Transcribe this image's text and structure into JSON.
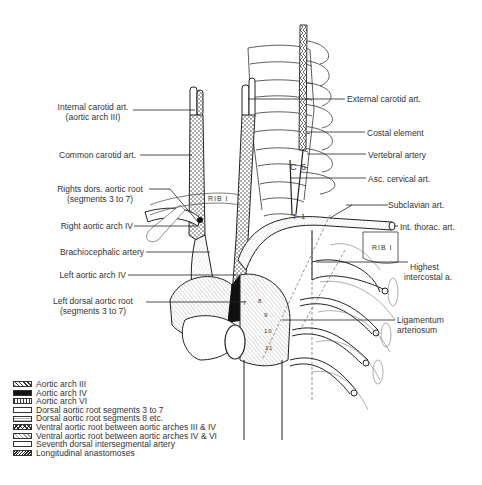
{
  "labels_left": [
    {
      "id": "internal-carotid",
      "lines": [
        "Internal carotid art.",
        "(aortic arch III)"
      ],
      "x": 132,
      "y": 107
    },
    {
      "id": "common-carotid",
      "lines": [
        "Common carotid art."
      ],
      "x": 137,
      "y": 153
    },
    {
      "id": "right-dorsal-aortic-root",
      "lines": [
        "Rights dors. aortic root",
        "(segments 3 to 7)"
      ],
      "x": 149,
      "y": 187
    },
    {
      "id": "right-aortic-arch-iv",
      "lines": [
        "Right aortic arch IV"
      ],
      "x": 134,
      "y": 222
    },
    {
      "id": "brachiocephalic",
      "lines": [
        "Brachiocephalic artery"
      ],
      "x": 144,
      "y": 251
    },
    {
      "id": "left-aortic-arch-iv",
      "lines": [
        "Left aortic arch IV"
      ],
      "x": 125,
      "y": 272
    },
    {
      "id": "left-dorsal-aortic-root",
      "lines": [
        "Left dorsal aortic root",
        "(segments 3 to 7)"
      ],
      "x": 140,
      "y": 296
    }
  ],
  "labels_right": [
    {
      "id": "external-carotid",
      "lines": [
        "External carotid art."
      ],
      "x": 346,
      "y": 95
    },
    {
      "id": "costal-element",
      "lines": [
        "Costal element"
      ],
      "x": 367,
      "y": 128
    },
    {
      "id": "vertebral-artery",
      "lines": [
        "Vertebral artery"
      ],
      "x": 368,
      "y": 150
    },
    {
      "id": "asc-cervical",
      "lines": [
        "Asc. cervical art."
      ],
      "x": 368,
      "y": 175
    },
    {
      "id": "subclavian",
      "lines": [
        "Subclavian art."
      ],
      "x": 388,
      "y": 200
    },
    {
      "id": "int-thoracic",
      "lines": [
        "Int. thorac. art."
      ],
      "x": 399,
      "y": 223
    },
    {
      "id": "highest-intercostal",
      "lines": [
        "Highest",
        "intercostal a."
      ],
      "x": 411,
      "y": 259
    },
    {
      "id": "ligamentum-arteriosum",
      "lines": [
        "Ligamentum",
        "arteriosum"
      ],
      "x": 397,
      "y": 316
    }
  ],
  "anatomical_tags": {
    "c6": "C 6",
    "t1": "T 1",
    "rib1_left": "RIB I",
    "rib1_right": "RIB I",
    "seg7": "7",
    "seg8": "8",
    "seg9": "9",
    "seg10": "10",
    "seg11": "11"
  },
  "legend": [
    {
      "label": "Aortic arch III",
      "pattern": "dots"
    },
    {
      "label": "Aortic arch IV",
      "pattern": "black"
    },
    {
      "label": "Aortic arch VI",
      "pattern": "vbars"
    },
    {
      "label": "Dorsal aortic root  segments 3 to 7",
      "pattern": "plain"
    },
    {
      "label": "Dorsal aortic root  segments 8 etc.",
      "pattern": "fine"
    },
    {
      "label": "Ventral aortic root between aortic arches III & IV",
      "pattern": "cross"
    },
    {
      "label": "Ventral aortic root between aortic arches IV & VI",
      "pattern": "light"
    },
    {
      "label": "Seventh dorsal intersegmental artery",
      "pattern": "plain"
    },
    {
      "label": "Longitudinal anastomoses",
      "pattern": "hatch"
    }
  ],
  "colors": {
    "ink": "#222222",
    "background": "#ffffff"
  }
}
